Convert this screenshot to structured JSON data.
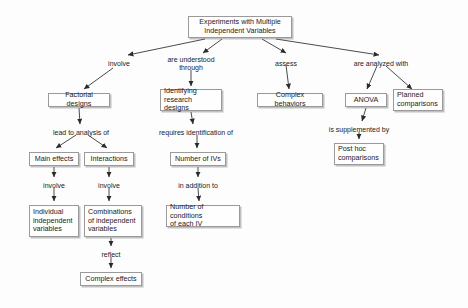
{
  "diagram": {
    "background": "#fdfdfd",
    "node_fill": "#fefefe",
    "node_border": "#9a9a9a",
    "text_color": "#1b1b1b"
  },
  "nodes": [
    {
      "id": "root",
      "label": "Experiments with Multiple\nIndependent Variables",
      "x": 188,
      "y": 16,
      "w": 104,
      "h": 22,
      "align": "center"
    },
    {
      "id": "factorial",
      "label": "Factorial designs",
      "x": 48,
      "y": 93,
      "w": 62,
      "h": 14,
      "align": "center"
    },
    {
      "id": "identifying",
      "label": "Identifying\nresearch designs",
      "x": 160,
      "y": 89,
      "w": 62,
      "h": 22,
      "align": "left"
    },
    {
      "id": "complexbeh",
      "label": "Complex behaviors",
      "x": 257,
      "y": 93,
      "w": 66,
      "h": 14,
      "align": "center"
    },
    {
      "id": "anova",
      "label": "ANOVA",
      "x": 345,
      "y": 93,
      "w": 42,
      "h": 14,
      "align": "center"
    },
    {
      "id": "planned",
      "label": "Planned\ncomparisons",
      "x": 393,
      "y": 89,
      "w": 50,
      "h": 22,
      "align": "left"
    },
    {
      "id": "maineffects",
      "label": "Main effects",
      "x": 29,
      "y": 152,
      "w": 50,
      "h": 14,
      "align": "center"
    },
    {
      "id": "interactions",
      "label": "Interactions",
      "x": 84,
      "y": 152,
      "w": 50,
      "h": 14,
      "align": "center"
    },
    {
      "id": "numivs",
      "label": "Number of IVs",
      "x": 170,
      "y": 152,
      "w": 56,
      "h": 14,
      "align": "center"
    },
    {
      "id": "posthoc",
      "label": "Post hoc\ncomparisons",
      "x": 334,
      "y": 143,
      "w": 50,
      "h": 22,
      "align": "left"
    },
    {
      "id": "individual",
      "label": "Individual\nindependent\nvariables",
      "x": 29,
      "y": 205,
      "w": 50,
      "h": 32,
      "align": "left"
    },
    {
      "id": "combinations",
      "label": "Combinations\nof independent\nvariables",
      "x": 84,
      "y": 205,
      "w": 58,
      "h": 32,
      "align": "left"
    },
    {
      "id": "numcond",
      "label": "Number of conditions\nof each IV",
      "x": 166,
      "y": 205,
      "w": 74,
      "h": 22,
      "align": "left"
    },
    {
      "id": "complexeff",
      "label": "Complex effects",
      "x": 80,
      "y": 272,
      "w": 62,
      "h": 14,
      "align": "center"
    }
  ],
  "edge_labels": [
    {
      "id": "involve-factorial",
      "text": "involve",
      "x": 119,
      "y": 60
    },
    {
      "id": "understood-through",
      "text": "are understood\nthrough",
      "x": 191,
      "y": 56
    },
    {
      "id": "assess",
      "text": "assess",
      "x": 286,
      "y": 60
    },
    {
      "id": "analyzed-with",
      "text": "are analyzed with",
      "x": 381,
      "y": 60
    },
    {
      "id": "lead-to-analysis",
      "text": "lead to analysis of",
      "x": 81,
      "y": 129
    },
    {
      "id": "requires-ident",
      "text": "requires identification of",
      "x": 196,
      "y": 129
    },
    {
      "id": "supplemented-by",
      "text": "is supplemented by",
      "x": 359,
      "y": 126
    },
    {
      "id": "involve-main",
      "text": "involve",
      "x": 54,
      "y": 182
    },
    {
      "id": "involve-inter",
      "text": "involve",
      "x": 109,
      "y": 182
    },
    {
      "id": "in-addition-to",
      "text": "in addition to",
      "x": 198,
      "y": 182
    },
    {
      "id": "reflect",
      "text": "reflect",
      "x": 111,
      "y": 251
    }
  ]
}
